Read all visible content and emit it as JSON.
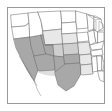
{
  "figure": {
    "kind": "choropleth-map",
    "region_label": "Contiguous United States",
    "frame_color": "#9a9a9a",
    "background_color": "#ffffff",
    "border_color": "#6f6f6f",
    "caption": ""
  },
  "legend": {
    "visible": false,
    "bins": [
      {
        "label": "none",
        "color": "#ffffff"
      },
      {
        "label": "low",
        "color": "#e8e8e8"
      },
      {
        "label": "medium",
        "color": "#cfcfcf"
      },
      {
        "label": "high",
        "color": "#a8a8a8"
      }
    ]
  },
  "chart_data": {
    "type": "heatmap",
    "title": "",
    "xlabel": "",
    "ylabel": "",
    "categories": [
      "WA",
      "OR",
      "CA",
      "NV",
      "ID",
      "MT",
      "WY",
      "UT",
      "AZ",
      "CO",
      "NM",
      "ND",
      "SD",
      "NE",
      "KS",
      "OK",
      "TX",
      "MN",
      "IA",
      "MO",
      "AR",
      "LA",
      "WI",
      "IL",
      "MI",
      "IN",
      "OH",
      "KY",
      "TN",
      "MS",
      "AL",
      "GA",
      "FL",
      "SC",
      "NC",
      "VA",
      "WV",
      "PA",
      "NY",
      "VT",
      "NH",
      "ME",
      "MA",
      "RI",
      "CT",
      "NJ",
      "DE",
      "MD"
    ],
    "values": [
      0,
      0,
      3,
      3,
      0,
      0,
      1,
      3,
      3,
      2,
      3,
      0,
      0,
      1,
      2,
      3,
      3,
      0,
      0,
      1,
      1,
      1,
      0,
      0,
      0,
      0,
      0,
      0,
      0,
      0,
      0,
      0,
      0,
      0,
      0,
      0,
      0,
      0,
      0,
      0,
      0,
      0,
      0,
      0,
      0,
      0,
      0,
      0
    ],
    "value_labels": [
      "none",
      "low",
      "medium",
      "high"
    ],
    "colormap": [
      "#ffffff",
      "#e8e8e8",
      "#cfcfcf",
      "#a8a8a8"
    ],
    "grid": false,
    "legend_position": "none"
  },
  "states": [
    {
      "id": "WA",
      "name": "Washington",
      "level": "none",
      "d": "M3,7 L20,5 L21,15 L17,18 L4,19 Z"
    },
    {
      "id": "OR",
      "name": "Oregon",
      "level": "none",
      "d": "M4,19 L17,18 L21,15 L22,29 L6,31 Z"
    },
    {
      "id": "CA",
      "name": "California",
      "level": "dark",
      "d": "M6,31 L22,29 L23,38 L26,48 L30,62 L26,73 L19,62 L13,50 L8,40 Z"
    },
    {
      "id": "NV",
      "name": "Nevada",
      "level": "dark",
      "d": "M22,29 L33,27 L38,46 L26,48 L23,38 Z"
    },
    {
      "id": "ID",
      "name": "Idaho",
      "level": "none",
      "d": "M21,15 L20,5 L30,4 L33,13 L35,27 L33,27 L22,29 Z"
    },
    {
      "id": "MT",
      "name": "Montana",
      "level": "none",
      "d": "M30,4 L53,3 L54,21 L35,23 L33,13 Z"
    },
    {
      "id": "WY",
      "name": "Wyoming",
      "level": "light",
      "d": "M35,23 L54,21 L55,36 L37,37 Z"
    },
    {
      "id": "UT",
      "name": "Utah",
      "level": "dark",
      "d": "M33,27 L35,27 L37,37 L45,37 L46,48 L38,46 Z"
    },
    {
      "id": "AZ",
      "name": "Arizona",
      "level": "dark",
      "d": "M26,48 L38,46 L46,48 L47,62 L31,63 L30,62 Z"
    },
    {
      "id": "CO",
      "name": "Colorado",
      "level": "mid",
      "d": "M37,37 L55,36 L56,49 L46,48 L45,37 Z"
    },
    {
      "id": "NM",
      "name": "New Mexico",
      "level": "dark",
      "d": "M46,48 L56,49 L57,64 L47,64 L47,62 Z"
    },
    {
      "id": "ND",
      "name": "North Dakota",
      "level": "none",
      "d": "M53,3 L68,3 L68,14 L54,15 Z"
    },
    {
      "id": "SD",
      "name": "South Dakota",
      "level": "none",
      "d": "M54,15 L68,14 L69,25 L54,26 Z"
    },
    {
      "id": "NE",
      "name": "Nebraska",
      "level": "light",
      "d": "M54,26 L69,25 L70,35 L55,36 Z"
    },
    {
      "id": "KS",
      "name": "Kansas",
      "level": "mid",
      "d": "M55,36 L70,35 L71,46 L56,47 Z"
    },
    {
      "id": "OK",
      "name": "Oklahoma",
      "level": "dark",
      "d": "M56,47 L71,46 L72,55 L57,56 Z"
    },
    {
      "id": "TX",
      "name": "Texas",
      "level": "dark",
      "d": "M47,64 L57,56 L72,55 L73,66 L66,78 L58,83 L50,77 L47,66 Z"
    },
    {
      "id": "MN",
      "name": "Minnesota",
      "level": "none",
      "d": "M68,3 L79,6 L80,20 L69,21 L68,14 Z"
    },
    {
      "id": "IA",
      "name": "Iowa",
      "level": "none",
      "d": "M69,25 L80,24 L81,33 L70,34 Z"
    },
    {
      "id": "MO",
      "name": "Missouri",
      "level": "light",
      "d": "M70,35 L81,34 L83,46 L72,47 L71,46 Z"
    },
    {
      "id": "AR",
      "name": "Arkansas",
      "level": "light",
      "d": "M72,47 L83,46 L84,56 L73,57 L72,55 Z"
    },
    {
      "id": "LA",
      "name": "Louisiana",
      "level": "light",
      "d": "M73,57 L84,56 L85,66 L74,67 L73,66 Z"
    },
    {
      "id": "WI",
      "name": "Wisconsin",
      "level": "none",
      "d": "M79,6 L87,9 L86,21 L80,23 L80,20 Z"
    },
    {
      "id": "IL",
      "name": "Illinois",
      "level": "none",
      "d": "M80,24 L86,22 L88,34 L82,37 L81,33 Z"
    },
    {
      "id": "MI",
      "name": "Michigan",
      "level": "none",
      "d": "M86,9 L93,11 L95,20 L89,24 L86,21 Z"
    },
    {
      "id": "IN",
      "name": "Indiana",
      "level": "none",
      "d": "M86,22 L90,24 L90,35 L88,34 Z"
    },
    {
      "id": "OH",
      "name": "Ohio",
      "level": "none",
      "d": "M90,24 L96,24 L96,33 L90,35 Z"
    },
    {
      "id": "KY",
      "name": "Kentucky",
      "level": "none",
      "d": "M82,37 L90,35 L96,33 L94,41 L84,42 Z"
    },
    {
      "id": "TN",
      "name": "Tennessee",
      "level": "none",
      "d": "M83,43 L94,41 L95,47 L84,48 Z"
    },
    {
      "id": "MS",
      "name": "Mississippi",
      "level": "none",
      "d": "M84,49 L89,48 L90,63 L85,64 Z"
    },
    {
      "id": "AL",
      "name": "Alabama",
      "level": "none",
      "d": "M89,48 L94,48 L94,62 L90,63 Z"
    },
    {
      "id": "GA",
      "name": "Georgia",
      "level": "none",
      "d": "M94,48 L96,55 L95,63 L94,62 Z"
    },
    {
      "id": "FL",
      "name": "Florida",
      "level": "none",
      "d": "M90,63 L96,63 L96,74 L92,72 Z"
    }
  ]
}
